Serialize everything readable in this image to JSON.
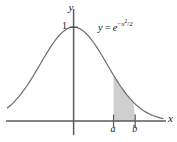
{
  "figure": {
    "equation": {
      "lhs": "y",
      "equals": "=",
      "base": "e",
      "exp_minus": "−",
      "exp_var": "x",
      "exp_power": "2",
      "exp_slash": "/",
      "exp_denom": "2",
      "plain": "y = e^(-x^2/2)"
    },
    "axes": {
      "x_label": "x",
      "y_label": "y",
      "y_tick_label": "1",
      "x_tick_labels": [
        "a",
        "b"
      ]
    },
    "colors": {
      "curve": "#6b6b6b",
      "axis": "#5a5a5a",
      "shade_fill": "#cfcfcf",
      "shade_stroke": "#8a8a8a",
      "text": "#1a1a1a",
      "background": "#ffffff"
    }
  },
  "chart_data": {
    "type": "line",
    "title": "",
    "subtitle": "",
    "xlabel": "x",
    "ylabel": "y",
    "function": "y = e^(-x^2/2)",
    "legend": [],
    "legend_position": "none",
    "grid": false,
    "annotations": [
      {
        "text": "y = e^{-x^2/2}",
        "x": 1.0,
        "y": 0.93
      },
      {
        "text": "1",
        "x": -0.22,
        "y": 1.0
      },
      {
        "text": "a",
        "x": 1.2,
        "y": -0.12
      },
      {
        "text": "b",
        "x": 1.85,
        "y": -0.12
      },
      {
        "text": "y",
        "x": -0.08,
        "y": 1.22
      },
      {
        "text": "x",
        "x": 2.78,
        "y": -0.06
      }
    ],
    "xlim": [
      -2.0,
      2.7
    ],
    "ylim": [
      0,
      1.22
    ],
    "shaded_region": {
      "from_label": "a",
      "to_label": "b",
      "from_x": 1.2,
      "to_x": 1.85,
      "fill": "#cfcfcf"
    },
    "ticks": {
      "x": [
        {
          "value": 1.2,
          "label": "a"
        },
        {
          "value": 1.85,
          "label": "b"
        }
      ],
      "y": [
        {
          "value": 1.0,
          "label": "1"
        }
      ]
    },
    "x": [
      -2.0,
      -1.9,
      -1.8,
      -1.7,
      -1.6,
      -1.5,
      -1.4,
      -1.3,
      -1.2,
      -1.1,
      -1.0,
      -0.9,
      -0.8,
      -0.7,
      -0.6,
      -0.5,
      -0.4,
      -0.3,
      -0.2,
      -0.1,
      0.0,
      0.1,
      0.2,
      0.3,
      0.4,
      0.5,
      0.6,
      0.7,
      0.8,
      0.9,
      1.0,
      1.1,
      1.2,
      1.3,
      1.4,
      1.5,
      1.6,
      1.7,
      1.8,
      1.9,
      2.0,
      2.1,
      2.2,
      2.3,
      2.4,
      2.5,
      2.6,
      2.7
    ],
    "y": [
      0.135,
      0.164,
      0.198,
      0.237,
      0.278,
      0.325,
      0.375,
      0.43,
      0.487,
      0.546,
      0.607,
      0.667,
      0.726,
      0.783,
      0.835,
      0.882,
      0.923,
      0.956,
      0.98,
      0.995,
      1.0,
      0.995,
      0.98,
      0.956,
      0.923,
      0.882,
      0.835,
      0.783,
      0.726,
      0.667,
      0.607,
      0.546,
      0.487,
      0.43,
      0.375,
      0.325,
      0.278,
      0.237,
      0.198,
      0.164,
      0.135,
      0.11,
      0.089,
      0.071,
      0.056,
      0.044,
      0.034,
      0.026
    ]
  }
}
